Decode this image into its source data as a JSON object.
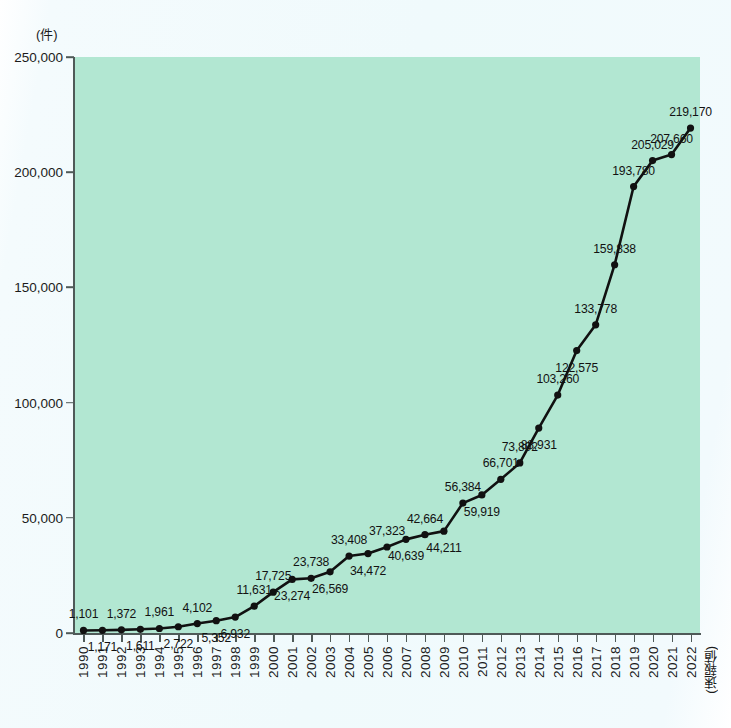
{
  "chart_data": {
    "type": "line",
    "title": "",
    "xlabel": "",
    "ylabel": "(件)",
    "unit_label": "(件)",
    "prelim_note": "(速報値)",
    "grid": false,
    "legend": "none",
    "ylim": [
      0,
      250000
    ],
    "ytick_labels": [
      "250,000",
      "200,000",
      "150,000",
      "100,000",
      "50,000",
      "0"
    ],
    "ytick_values": [
      250000,
      200000,
      150000,
      100000,
      50000,
      0
    ],
    "categories": [
      "1990",
      "1991",
      "1992",
      "1993",
      "1994",
      "1995",
      "1996",
      "1997",
      "1998",
      "1999",
      "2000",
      "2001",
      "2002",
      "2003",
      "2004",
      "2005",
      "2006",
      "2007",
      "2008",
      "2009",
      "2010",
      "2011",
      "2012",
      "2013",
      "2014",
      "2015",
      "2016",
      "2017",
      "2018",
      "2019",
      "2020",
      "2021",
      "2022"
    ],
    "values": [
      1101,
      1171,
      1372,
      1611,
      1961,
      2722,
      4102,
      5352,
      6932,
      11631,
      17725,
      23274,
      23738,
      26569,
      33408,
      34472,
      37323,
      40639,
      42664,
      44211,
      56384,
      59919,
      66701,
      73802,
      88931,
      103260,
      122575,
      133778,
      159838,
      193780,
      205029,
      207660,
      219170
    ],
    "point_labels": [
      "1,101",
      "1,171",
      "1,372",
      "1,611",
      "1,961",
      "2,722",
      "4,102",
      "5,352",
      "6,932",
      "11,631",
      "17,725",
      "23,274",
      "23,738",
      "26,569",
      "33,408",
      "34,472",
      "37,323",
      "40,639",
      "42,664",
      "44,211",
      "56,384",
      "59,919",
      "66,701",
      "73,802",
      "88,931",
      "103,260",
      "122,575",
      "133,778",
      "159,838",
      "193,780",
      "205,029",
      "207,660",
      "219,170"
    ],
    "label_placement": [
      "above",
      "below",
      "above",
      "below",
      "above",
      "below",
      "above",
      "below",
      "below",
      "above",
      "above",
      "below",
      "above",
      "below",
      "above",
      "below",
      "above",
      "below",
      "above",
      "below",
      "above",
      "below",
      "above",
      "above",
      "below",
      "above",
      "below",
      "above",
      "above",
      "above",
      "above",
      "above",
      "above"
    ],
    "colors": {
      "plot_background": "#b2e7d2",
      "page_background": "#f1fafc",
      "line": "#111111",
      "marker": "#111111",
      "axis": "#4f5a58",
      "text": "#1b1b1b"
    }
  }
}
